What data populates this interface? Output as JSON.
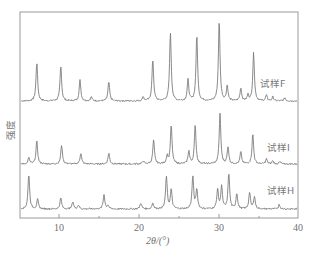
{
  "chart_data": {
    "type": "line",
    "title": "",
    "xlabel": "2θ/(°)",
    "ylabel": "强度",
    "xlim": [
      5,
      40
    ],
    "xticks": [
      10,
      20,
      30,
      40
    ],
    "xtick_labels": [
      "10",
      "20",
      "30",
      "40"
    ],
    "grid": false,
    "legend_position": "inline-right",
    "layout": "stacked-offset",
    "series": [
      {
        "name": "试样F",
        "baseline_y_px": 101,
        "peaks": [
          {
            "two_theta": 7.1,
            "rel_intensity": 0.49
          },
          {
            "two_theta": 10.1,
            "rel_intensity": 0.44
          },
          {
            "two_theta": 12.5,
            "rel_intensity": 0.26
          },
          {
            "two_theta": 13.9,
            "rel_intensity": 0.05
          },
          {
            "two_theta": 16.1,
            "rel_intensity": 0.24
          },
          {
            "two_theta": 20.4,
            "rel_intensity": 0.05
          },
          {
            "two_theta": 21.6,
            "rel_intensity": 0.52
          },
          {
            "two_theta": 23.8,
            "rel_intensity": 0.86
          },
          {
            "two_theta": 26.0,
            "rel_intensity": 0.26
          },
          {
            "two_theta": 27.1,
            "rel_intensity": 0.82
          },
          {
            "two_theta": 29.9,
            "rel_intensity": 1.0
          },
          {
            "two_theta": 30.9,
            "rel_intensity": 0.19
          },
          {
            "two_theta": 32.6,
            "rel_intensity": 0.16
          },
          {
            "two_theta": 33.5,
            "rel_intensity": 0.07
          },
          {
            "two_theta": 34.2,
            "rel_intensity": 0.6
          },
          {
            "two_theta": 35.8,
            "rel_intensity": 0.07
          },
          {
            "two_theta": 36.6,
            "rel_intensity": 0.05
          },
          {
            "two_theta": 38.1,
            "rel_intensity": 0.04
          }
        ]
      },
      {
        "name": "试样I",
        "baseline_y_px": 164,
        "peaks": [
          {
            "two_theta": 6.1,
            "rel_intensity": 0.12
          },
          {
            "two_theta": 7.1,
            "rel_intensity": 0.46
          },
          {
            "two_theta": 10.2,
            "rel_intensity": 0.38
          },
          {
            "two_theta": 12.6,
            "rel_intensity": 0.22
          },
          {
            "two_theta": 16.1,
            "rel_intensity": 0.22
          },
          {
            "two_theta": 20.4,
            "rel_intensity": 0.06
          },
          {
            "two_theta": 21.7,
            "rel_intensity": 0.48
          },
          {
            "two_theta": 23.4,
            "rel_intensity": 0.16
          },
          {
            "two_theta": 23.9,
            "rel_intensity": 0.78
          },
          {
            "two_theta": 26.1,
            "rel_intensity": 0.26
          },
          {
            "two_theta": 26.9,
            "rel_intensity": 0.78
          },
          {
            "two_theta": 30.0,
            "rel_intensity": 1.0
          },
          {
            "two_theta": 31.0,
            "rel_intensity": 0.34
          },
          {
            "two_theta": 32.6,
            "rel_intensity": 0.24
          },
          {
            "two_theta": 34.1,
            "rel_intensity": 0.6
          },
          {
            "two_theta": 35.8,
            "rel_intensity": 0.1
          },
          {
            "two_theta": 36.6,
            "rel_intensity": 0.06
          },
          {
            "two_theta": 37.5,
            "rel_intensity": 0.04
          }
        ]
      },
      {
        "name": "试样H",
        "baseline_y_px": 209,
        "peaks": [
          {
            "two_theta": 6.1,
            "rel_intensity": 0.97
          },
          {
            "two_theta": 7.2,
            "rel_intensity": 0.26
          },
          {
            "two_theta": 10.1,
            "rel_intensity": 0.31
          },
          {
            "two_theta": 11.6,
            "rel_intensity": 0.2
          },
          {
            "two_theta": 12.3,
            "rel_intensity": 0.11
          },
          {
            "two_theta": 15.5,
            "rel_intensity": 0.4
          },
          {
            "two_theta": 16.0,
            "rel_intensity": 0.1
          },
          {
            "two_theta": 20.1,
            "rel_intensity": 0.17
          },
          {
            "two_theta": 21.6,
            "rel_intensity": 0.17
          },
          {
            "two_theta": 23.3,
            "rel_intensity": 0.91
          },
          {
            "two_theta": 23.9,
            "rel_intensity": 0.54
          },
          {
            "two_theta": 26.6,
            "rel_intensity": 0.91
          },
          {
            "two_theta": 27.1,
            "rel_intensity": 0.54
          },
          {
            "two_theta": 29.7,
            "rel_intensity": 0.54
          },
          {
            "two_theta": 30.2,
            "rel_intensity": 0.63
          },
          {
            "two_theta": 31.1,
            "rel_intensity": 1.0
          },
          {
            "two_theta": 32.1,
            "rel_intensity": 0.43
          },
          {
            "two_theta": 33.7,
            "rel_intensity": 0.46
          },
          {
            "two_theta": 34.3,
            "rel_intensity": 0.34
          },
          {
            "two_theta": 37.4,
            "rel_intensity": 0.12
          }
        ]
      }
    ]
  },
  "labels": {
    "ylabel": "强度",
    "xlabel": "2θ/(°)",
    "series_F": "试样F",
    "series_I": "试样I",
    "series_H": "试样H",
    "tick_10": "10",
    "tick_20": "20",
    "tick_30": "30",
    "tick_40": "40"
  },
  "colors": {
    "trace": "#7d7d7d",
    "frame": "#9a9a9a",
    "text": "#707070"
  }
}
